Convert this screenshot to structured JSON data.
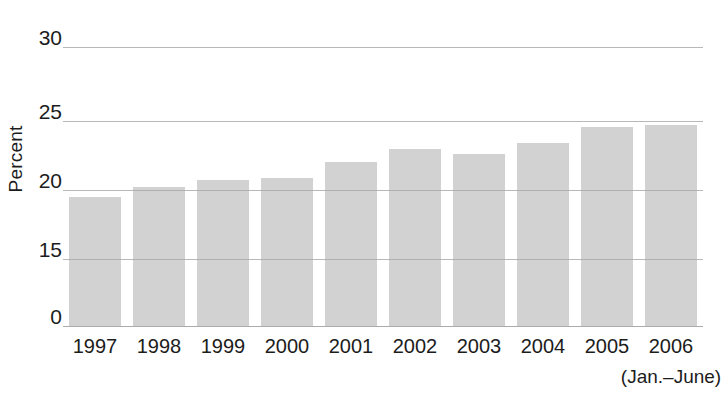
{
  "chart_data": {
    "type": "bar",
    "title": "",
    "subtitle": "",
    "xlabel": "",
    "ylabel": "Percent",
    "categories": [
      "1997",
      "1998",
      "1999",
      "2000",
      "2001",
      "2002",
      "2003",
      "2004",
      "2005",
      "2006"
    ],
    "values": [
      19.5,
      20.2,
      20.7,
      20.9,
      22.0,
      23.0,
      22.6,
      23.4,
      24.6,
      24.7
    ],
    "series": [
      {
        "name": "Percent",
        "values": [
          19.5,
          20.2,
          20.7,
          20.9,
          22.0,
          23.0,
          22.6,
          23.4,
          24.6,
          24.7
        ]
      }
    ],
    "y_tick_labels": [
      "30",
      "25",
      "20",
      "15",
      "0"
    ],
    "y_tick_values": [
      30,
      25,
      20,
      15,
      0
    ],
    "ylim": [
      0,
      30
    ],
    "axis_break": true,
    "axis_break_note": "y-axis is broken between 0 and 15",
    "grid": true,
    "grid_orientation": "horizontal",
    "legend": null,
    "legend_position": "none",
    "annotations": [
      {
        "text": "(Jan.–June)",
        "attached_to": "2006"
      }
    ],
    "bar_color": "#d2d2d2",
    "gridline_color": "#a8a8a8",
    "background_color": "#ffffff",
    "text_color": "#1c1c1c"
  },
  "axis": {
    "y_title": "Percent",
    "y_ticks": [
      {
        "label": "30",
        "value": 30
      },
      {
        "label": "25",
        "value": 25
      },
      {
        "label": "20",
        "value": 20
      },
      {
        "label": "15",
        "value": 15
      },
      {
        "label": "0",
        "value": 0
      }
    ],
    "x_ticks": [
      {
        "label": "1997"
      },
      {
        "label": "1998"
      },
      {
        "label": "1999"
      },
      {
        "label": "2000"
      },
      {
        "label": "2001"
      },
      {
        "label": "2002"
      },
      {
        "label": "2003"
      },
      {
        "label": "2004"
      },
      {
        "label": "2005"
      },
      {
        "label": "2006"
      }
    ],
    "x_note": "(Jan.–June)"
  }
}
